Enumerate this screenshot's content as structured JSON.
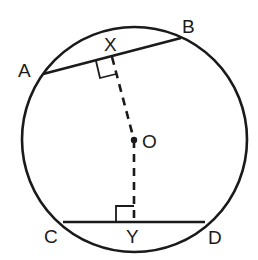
{
  "diagram": {
    "type": "circle-chord-geometry",
    "colors": {
      "stroke": "#1a1a1a",
      "background": "#ffffff"
    },
    "labels": {
      "A": "A",
      "B": "B",
      "X": "X",
      "O": "O",
      "C": "C",
      "Y": "Y",
      "D": "D"
    },
    "points": {
      "A": [
        43,
        74
      ],
      "B": [
        181,
        38
      ],
      "X": [
        112,
        57
      ],
      "O": [
        134,
        140
      ],
      "C": [
        63,
        222
      ],
      "D": [
        205,
        222
      ],
      "Y": [
        134,
        222
      ]
    },
    "circle": {
      "cx": 134.5,
      "cy": 139.5,
      "r": 112.5
    },
    "right_angle_marks": [
      "X",
      "Y"
    ],
    "dashed_segments": [
      "OX",
      "OY"
    ],
    "chords": [
      "AB",
      "CD"
    ]
  }
}
